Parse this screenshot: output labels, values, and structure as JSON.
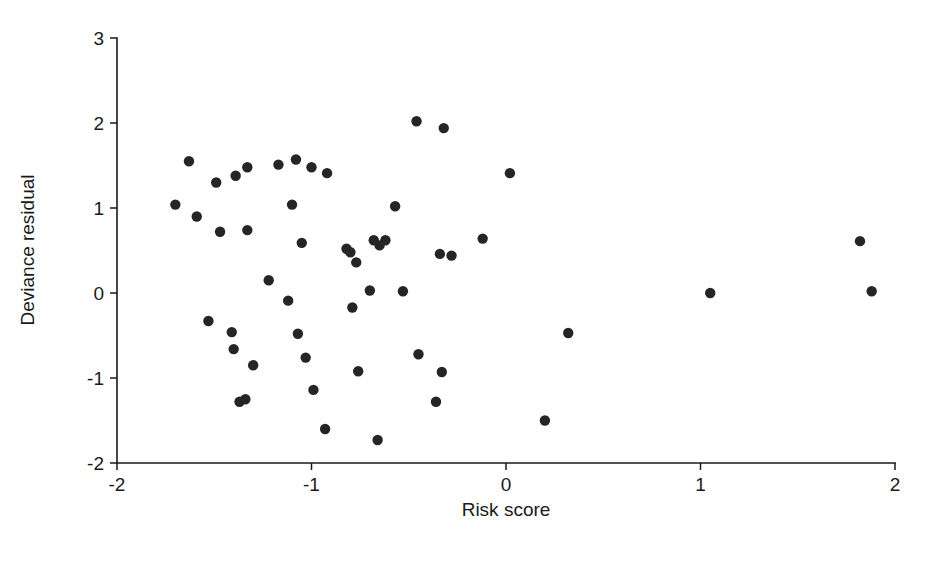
{
  "chart_data": {
    "type": "scatter",
    "title": "",
    "xlabel": "Risk score",
    "ylabel": "Deviance residual",
    "xlim": [
      -2,
      2
    ],
    "ylim": [
      -2,
      3
    ],
    "xticks": [
      -2,
      -1,
      0,
      1,
      2
    ],
    "yticks": [
      -2,
      -1,
      0,
      1,
      2,
      3
    ],
    "xtick_labels": [
      "-2",
      "-1",
      "0",
      "1",
      "2"
    ],
    "ytick_labels": [
      "-2",
      "-1",
      "0",
      "1",
      "2",
      "3"
    ],
    "grid": false,
    "legend": null,
    "marker": {
      "shape": "circle",
      "color": "#252525",
      "size_px": 5.2
    },
    "series": [
      {
        "name": "Deviance residuals",
        "points": [
          [
            -1.7,
            1.04
          ],
          [
            -1.63,
            1.55
          ],
          [
            -1.59,
            0.9
          ],
          [
            -1.49,
            1.3
          ],
          [
            -1.47,
            0.72
          ],
          [
            -1.39,
            1.38
          ],
          [
            -1.33,
            0.74
          ],
          [
            -1.33,
            1.48
          ],
          [
            -1.53,
            -0.33
          ],
          [
            -1.41,
            -0.46
          ],
          [
            -1.4,
            -0.66
          ],
          [
            -1.37,
            -1.28
          ],
          [
            -1.34,
            -1.25
          ],
          [
            -1.3,
            -0.85
          ],
          [
            -1.22,
            0.15
          ],
          [
            -1.17,
            1.51
          ],
          [
            -1.12,
            -0.09
          ],
          [
            -1.1,
            1.04
          ],
          [
            -1.08,
            1.57
          ],
          [
            -1.07,
            -0.48
          ],
          [
            -1.05,
            0.59
          ],
          [
            -1.03,
            -0.76
          ],
          [
            -1.0,
            1.48
          ],
          [
            -0.99,
            -1.14
          ],
          [
            -0.93,
            -1.6
          ],
          [
            -0.92,
            1.41
          ],
          [
            -0.82,
            0.52
          ],
          [
            -0.8,
            0.48
          ],
          [
            -0.79,
            -0.17
          ],
          [
            -0.77,
            0.36
          ],
          [
            -0.76,
            -0.92
          ],
          [
            -0.7,
            0.03
          ],
          [
            -0.68,
            0.62
          ],
          [
            -0.66,
            -1.73
          ],
          [
            -0.65,
            0.56
          ],
          [
            -0.62,
            0.62
          ],
          [
            -0.57,
            1.02
          ],
          [
            -0.53,
            0.02
          ],
          [
            -0.46,
            2.02
          ],
          [
            -0.45,
            -0.72
          ],
          [
            -0.36,
            -1.28
          ],
          [
            -0.34,
            0.46
          ],
          [
            -0.33,
            -0.93
          ],
          [
            -0.32,
            1.94
          ],
          [
            -0.28,
            0.44
          ],
          [
            -0.12,
            0.64
          ],
          [
            0.02,
            1.41
          ],
          [
            0.2,
            -1.5
          ],
          [
            0.32,
            -0.47
          ],
          [
            1.05,
            0.0
          ],
          [
            1.82,
            0.61
          ],
          [
            1.88,
            0.02
          ]
        ]
      }
    ]
  },
  "axes": {
    "x_title": "Risk score",
    "y_title": "Deviance residual"
  }
}
